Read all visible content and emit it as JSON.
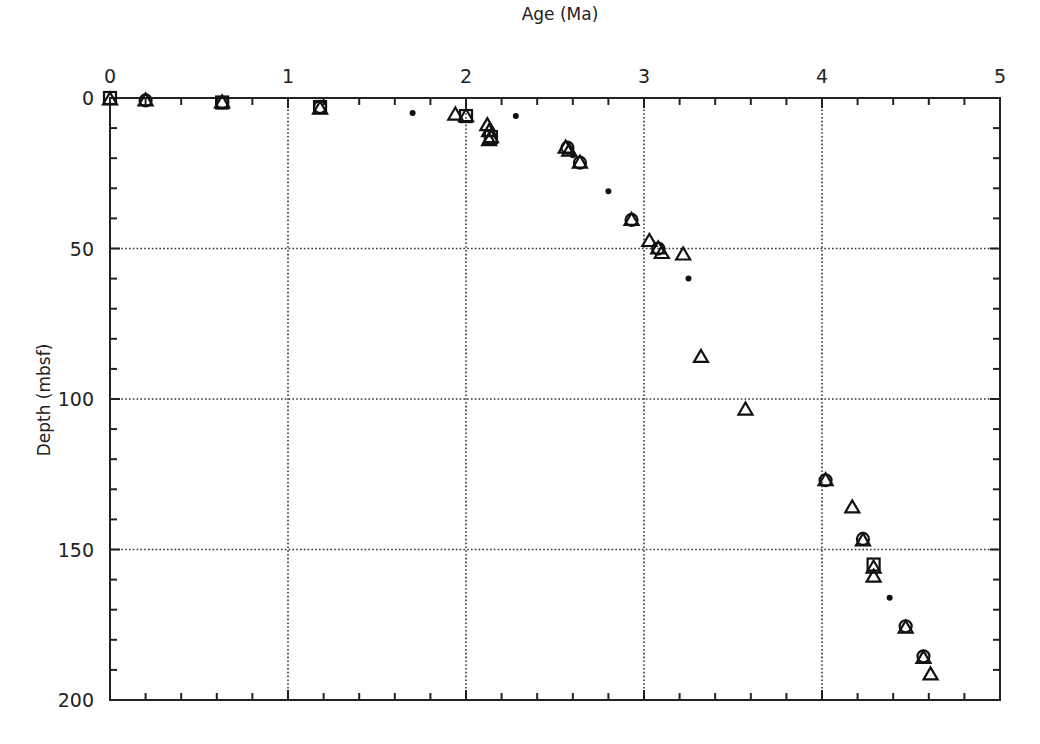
{
  "chart_data": {
    "type": "scatter",
    "title": "",
    "xlabel": "Age (Ma)",
    "ylabel": "Depth (mbsf)",
    "xlim": [
      0,
      5
    ],
    "ylim": [
      200,
      0
    ],
    "x_axis_position": "top",
    "y_inverted": true,
    "x_ticks": [
      0,
      1,
      2,
      3,
      4,
      5
    ],
    "y_ticks": [
      0,
      50,
      100,
      150,
      200
    ],
    "x_minor_step": 0.2,
    "y_minor_step": 10,
    "grid": "dotted at major ticks",
    "legend": null,
    "series": [
      {
        "name": "triangle",
        "marker": "triangle-open",
        "points": [
          [
            0.0,
            0.5
          ],
          [
            0.2,
            0.8
          ],
          [
            0.63,
            1.5
          ],
          [
            1.18,
            3.5
          ],
          [
            1.94,
            5.5
          ],
          [
            2.0,
            6.0
          ],
          [
            2.12,
            9.0
          ],
          [
            2.13,
            11.0
          ],
          [
            2.14,
            13.0
          ],
          [
            2.13,
            14.0
          ],
          [
            2.56,
            16.5
          ],
          [
            2.58,
            17.5
          ],
          [
            2.64,
            21.5
          ],
          [
            2.93,
            40.5
          ],
          [
            3.03,
            47.5
          ],
          [
            3.08,
            50.0
          ],
          [
            3.1,
            51.5
          ],
          [
            3.22,
            52.0
          ],
          [
            3.32,
            86.0
          ],
          [
            3.57,
            103.5
          ],
          [
            4.02,
            127.0
          ],
          [
            4.17,
            136.0
          ],
          [
            4.23,
            147.0
          ],
          [
            4.29,
            156.0
          ],
          [
            4.29,
            159.0
          ],
          [
            4.47,
            176.0
          ],
          [
            4.57,
            186.0
          ],
          [
            4.61,
            191.5
          ]
        ]
      },
      {
        "name": "circle",
        "marker": "circle-open",
        "points": [
          [
            0.2,
            0.8
          ],
          [
            0.63,
            1.5
          ],
          [
            1.18,
            3.0
          ],
          [
            2.57,
            16.5
          ],
          [
            2.64,
            21.5
          ],
          [
            2.93,
            40.5
          ],
          [
            3.08,
            50.0
          ],
          [
            4.02,
            127.0
          ],
          [
            4.23,
            146.5
          ],
          [
            4.47,
            175.5
          ],
          [
            4.57,
            185.5
          ]
        ]
      },
      {
        "name": "square",
        "marker": "square-open",
        "points": [
          [
            0.0,
            0.0
          ],
          [
            0.63,
            1.5
          ],
          [
            1.18,
            3.0
          ],
          [
            2.0,
            6.0
          ],
          [
            2.14,
            13.0
          ],
          [
            4.29,
            155.0
          ]
        ]
      },
      {
        "name": "dot",
        "marker": "filled-dot",
        "points": [
          [
            1.7,
            5.0
          ],
          [
            2.28,
            6.0
          ],
          [
            2.6,
            19.0
          ],
          [
            2.8,
            31.0
          ],
          [
            3.25,
            60.0
          ],
          [
            4.38,
            166.0
          ]
        ]
      }
    ]
  }
}
